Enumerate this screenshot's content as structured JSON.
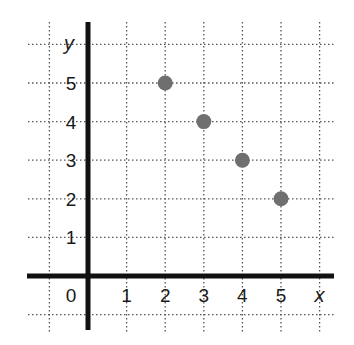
{
  "chart_data": {
    "type": "scatter",
    "title": "",
    "xlabel": "x",
    "ylabel": "y",
    "x_ticks": [
      "0",
      "1",
      "2",
      "3",
      "4",
      "5"
    ],
    "y_ticks": [
      "1",
      "2",
      "3",
      "4",
      "5"
    ],
    "xlim": [
      -1,
      6
    ],
    "ylim": [
      -1,
      6
    ],
    "grid": true,
    "grid_style": "dotted",
    "points": [
      {
        "x": 2,
        "y": 5
      },
      {
        "x": 3,
        "y": 4
      },
      {
        "x": 4,
        "y": 3
      },
      {
        "x": 5,
        "y": 2
      }
    ],
    "colors": {
      "point": "#6f6f6f",
      "axis": "#111111",
      "grid": "#555555"
    }
  }
}
